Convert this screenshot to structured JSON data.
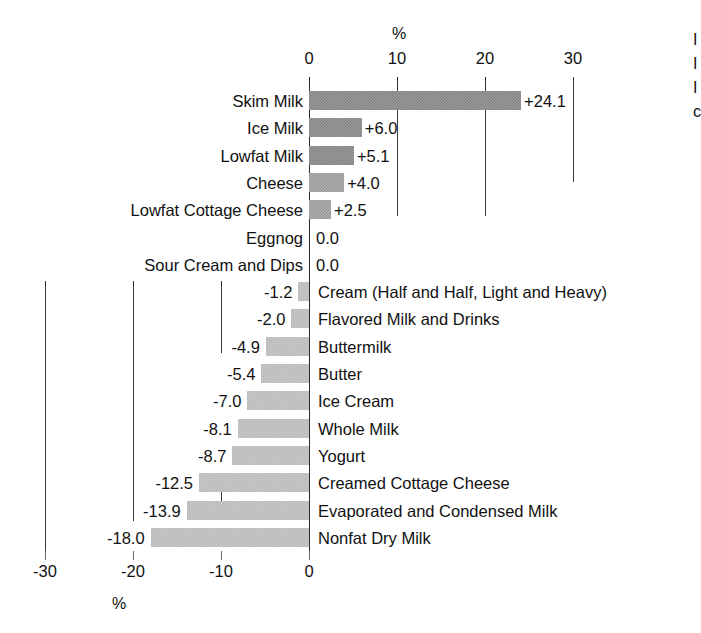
{
  "chart_data": {
    "type": "bar",
    "title": "",
    "orientation": "horizontal",
    "xlabel": "%",
    "ylabel": "",
    "xlim": [
      -30,
      30
    ],
    "grid": true,
    "legend": "none",
    "top_axis": {
      "unit": "%",
      "ticks": [
        0,
        10,
        20,
        30
      ],
      "tick_labels": [
        "0",
        "10",
        "20",
        "30"
      ]
    },
    "bottom_axis": {
      "unit": "%",
      "ticks": [
        -30,
        -20,
        -10,
        0
      ],
      "tick_labels": [
        "-30",
        "-20",
        "-10",
        "0"
      ]
    },
    "categories": [
      "Skim Milk",
      "Ice Milk",
      "Lowfat Milk",
      "Cheese",
      "Lowfat Cottage Cheese",
      "Eggnog",
      "Sour Cream and Dips",
      "Cream (Half and Half, Light and Heavy)",
      "Flavored Milk and Drinks",
      "Buttermilk",
      "Butter",
      "Ice Cream",
      "Whole Milk",
      "Yogurt",
      "Creamed Cottage Cheese",
      "Evaporated and Condensed Milk",
      "Nonfat Dry Milk"
    ],
    "values": [
      24.1,
      6.0,
      5.1,
      4.0,
      2.5,
      0.0,
      0.0,
      -1.2,
      -2.0,
      -4.9,
      -5.4,
      -7.0,
      -8.1,
      -8.7,
      -12.5,
      -13.9,
      -18.0
    ],
    "value_labels": [
      "+24.1",
      "+6.0",
      "+5.1",
      "+4.0",
      "+2.5",
      "0.0",
      "0.0",
      "-1.2",
      "-2.0",
      "-4.9",
      "-5.4",
      "-7.0",
      "-8.1",
      "-8.7",
      "-12.5",
      "-13.9",
      "-18.0"
    ],
    "colors": {
      "positive_fill": "#9b9b9b",
      "negative_fill": "#c9c9c9",
      "axis": "#2b2b2b",
      "text": "#111111",
      "background": "#ffffff"
    }
  },
  "rows": [
    {
      "label": "Skim Milk",
      "value_label": "+24.1",
      "value": 24.1,
      "side": "positive",
      "fill": "dark"
    },
    {
      "label": "Ice Milk",
      "value_label": "+6.0",
      "value": 6.0,
      "side": "positive",
      "fill": "dark"
    },
    {
      "label": "Lowfat Milk",
      "value_label": "+5.1",
      "value": 5.1,
      "side": "positive",
      "fill": "dark"
    },
    {
      "label": "Cheese",
      "value_label": "+4.0",
      "value": 4.0,
      "side": "positive",
      "fill": "mid"
    },
    {
      "label": "Lowfat Cottage Cheese",
      "value_label": "+2.5",
      "value": 2.5,
      "side": "positive",
      "fill": "mid"
    },
    {
      "label": "Eggnog",
      "value_label": "0.0",
      "value": 0.0,
      "side": "zero",
      "fill": "none"
    },
    {
      "label": "Sour Cream and Dips",
      "value_label": "0.0",
      "value": 0.0,
      "side": "zero",
      "fill": "none"
    },
    {
      "label": "Cream (Half and Half, Light and Heavy)",
      "value_label": "-1.2",
      "value": -1.2,
      "side": "negative",
      "fill": "lightfill"
    },
    {
      "label": "Flavored Milk and Drinks",
      "value_label": "-2.0",
      "value": -2.0,
      "side": "negative",
      "fill": "lightfill"
    },
    {
      "label": "Buttermilk",
      "value_label": "-4.9",
      "value": -4.9,
      "side": "negative",
      "fill": "lightfill"
    },
    {
      "label": "Butter",
      "value_label": "-5.4",
      "value": -5.4,
      "side": "negative",
      "fill": "lightfill"
    },
    {
      "label": "Ice Cream",
      "value_label": "-7.0",
      "value": -7.0,
      "side": "negative",
      "fill": "lightfill"
    },
    {
      "label": "Whole Milk",
      "value_label": "-8.1",
      "value": -8.1,
      "side": "negative",
      "fill": "lightfill"
    },
    {
      "label": "Yogurt",
      "value_label": "-8.7",
      "value": -8.7,
      "side": "negative",
      "fill": "lightfill"
    },
    {
      "label": "Creamed Cottage Cheese",
      "value_label": "-12.5",
      "value": -12.5,
      "side": "negative",
      "fill": "lightfill"
    },
    {
      "label": "Evaporated and Condensed Milk",
      "value_label": "-13.9",
      "value": -13.9,
      "side": "negative",
      "fill": "lightfill"
    },
    {
      "label": "Nonfat Dry Milk",
      "value_label": "-18.0",
      "value": -18.0,
      "side": "negative",
      "fill": "lightfill"
    }
  ],
  "top_ticks": [
    {
      "label": "0",
      "value": 0
    },
    {
      "label": "10",
      "value": 10
    },
    {
      "label": "20",
      "value": 20
    },
    {
      "label": "30",
      "value": 30
    }
  ],
  "bottom_ticks": [
    {
      "label": "-30",
      "value": -30
    },
    {
      "label": "-20",
      "value": -20
    },
    {
      "label": "-10",
      "value": -10
    },
    {
      "label": "0",
      "value": 0
    }
  ],
  "units": {
    "top": "%",
    "bottom": "%"
  },
  "edge_fragments": [
    "I",
    "I",
    "I",
    "c"
  ]
}
